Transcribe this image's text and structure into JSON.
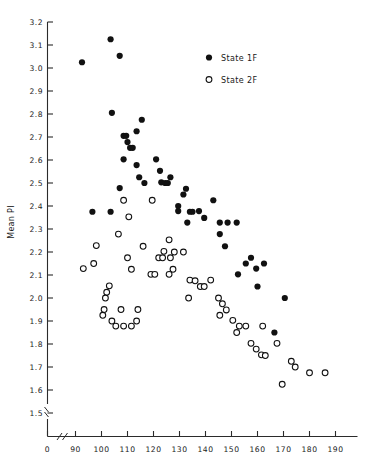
{
  "chart_data": {
    "type": "scatter",
    "title": "",
    "xlabel": "",
    "ylabel": "Mean PI",
    "xlim": [
      85,
      190
    ],
    "ylim": [
      1.45,
      3.2
    ],
    "grid": false,
    "axis_break": true,
    "legend_position": "top-right",
    "xticks": [
      "0",
      "90",
      "100",
      "110",
      "120",
      "130",
      "140",
      "150",
      "160",
      "170",
      "180",
      "190"
    ],
    "xtick_values": [
      0,
      90,
      100,
      110,
      120,
      130,
      140,
      150,
      160,
      170,
      180,
      190
    ],
    "yticks": [
      "1.5",
      "1.6",
      "1.7",
      "1.8",
      "1.9",
      "2.0",
      "2.1",
      "2.2",
      "2.3",
      "2.4",
      "2.5",
      "2.6",
      "2.7",
      "2.8",
      "2.9",
      "3.0",
      "3.1",
      "3.2"
    ],
    "ytick_values": [
      1.5,
      1.6,
      1.7,
      1.8,
      1.9,
      2.0,
      2.1,
      2.2,
      2.3,
      2.4,
      2.5,
      2.6,
      2.7,
      2.8,
      2.9,
      3.0,
      3.1,
      3.2
    ],
    "series": [
      {
        "name": "State 1F",
        "marker": "filled-circle",
        "color": "#111111",
        "points": [
          [
            92.5,
            3.025
          ],
          [
            103.5,
            3.125
          ],
          [
            107.0,
            3.053
          ],
          [
            104.0,
            2.805
          ],
          [
            115.5,
            2.775
          ],
          [
            108.5,
            2.705
          ],
          [
            109.5,
            2.705
          ],
          [
            110.0,
            2.678
          ],
          [
            113.5,
            2.725
          ],
          [
            111.0,
            2.653
          ],
          [
            112.0,
            2.653
          ],
          [
            108.5,
            2.603
          ],
          [
            121.0,
            2.603
          ],
          [
            113.5,
            2.578
          ],
          [
            122.5,
            2.553
          ],
          [
            114.5,
            2.525
          ],
          [
            126.5,
            2.525
          ],
          [
            116.5,
            2.5
          ],
          [
            123.0,
            2.503
          ],
          [
            124.5,
            2.5
          ],
          [
            125.5,
            2.5
          ],
          [
            107.0,
            2.478
          ],
          [
            132.5,
            2.475
          ],
          [
            131.5,
            2.45
          ],
          [
            129.5,
            2.4
          ],
          [
            143.0,
            2.425
          ],
          [
            96.5,
            2.375
          ],
          [
            103.5,
            2.375
          ],
          [
            129.5,
            2.378
          ],
          [
            134.0,
            2.375
          ],
          [
            135.0,
            2.375
          ],
          [
            137.5,
            2.378
          ],
          [
            133.0,
            2.328
          ],
          [
            139.5,
            2.348
          ],
          [
            145.5,
            2.328
          ],
          [
            148.5,
            2.328
          ],
          [
            152.0,
            2.328
          ],
          [
            145.5,
            2.278
          ],
          [
            147.5,
            2.225
          ],
          [
            157.5,
            2.175
          ],
          [
            155.5,
            2.15
          ],
          [
            162.5,
            2.15
          ],
          [
            159.5,
            2.128
          ],
          [
            152.5,
            2.103
          ],
          [
            160.0,
            2.05
          ],
          [
            170.5,
            2.0
          ],
          [
            166.5,
            1.85
          ]
        ]
      },
      {
        "name": "State 2F",
        "marker": "open-circle",
        "color": "#111111",
        "points": [
          [
            108.5,
            2.425
          ],
          [
            119.5,
            2.425
          ],
          [
            110.5,
            2.353
          ],
          [
            106.5,
            2.278
          ],
          [
            126.0,
            2.253
          ],
          [
            98.0,
            2.228
          ],
          [
            116.0,
            2.225
          ],
          [
            110.0,
            2.175
          ],
          [
            122.0,
            2.175
          ],
          [
            123.5,
            2.175
          ],
          [
            126.5,
            2.175
          ],
          [
            128.0,
            2.2
          ],
          [
            124.0,
            2.203
          ],
          [
            131.5,
            2.2
          ],
          [
            93.0,
            2.128
          ],
          [
            97.0,
            2.15
          ],
          [
            111.5,
            2.125
          ],
          [
            127.5,
            2.125
          ],
          [
            119.0,
            2.103
          ],
          [
            120.5,
            2.103
          ],
          [
            126.0,
            2.103
          ],
          [
            134.0,
            2.078
          ],
          [
            136.0,
            2.075
          ],
          [
            142.0,
            2.078
          ],
          [
            138.0,
            2.05
          ],
          [
            139.5,
            2.05
          ],
          [
            103.0,
            2.053
          ],
          [
            102.0,
            2.025
          ],
          [
            101.5,
            2.0
          ],
          [
            133.5,
            2.0
          ],
          [
            145.0,
            2.0
          ],
          [
            146.5,
            1.975
          ],
          [
            101.0,
            1.95
          ],
          [
            107.5,
            1.95
          ],
          [
            114.0,
            1.95
          ],
          [
            148.0,
            1.948
          ],
          [
            100.5,
            1.925
          ],
          [
            145.5,
            1.925
          ],
          [
            104.0,
            1.9
          ],
          [
            113.5,
            1.9
          ],
          [
            150.5,
            1.903
          ],
          [
            105.5,
            1.878
          ],
          [
            108.5,
            1.878
          ],
          [
            111.5,
            1.878
          ],
          [
            153.0,
            1.878
          ],
          [
            155.5,
            1.878
          ],
          [
            162.0,
            1.878
          ],
          [
            152.0,
            1.85
          ],
          [
            157.5,
            1.803
          ],
          [
            167.5,
            1.803
          ],
          [
            159.5,
            1.778
          ],
          [
            161.5,
            1.753
          ],
          [
            163.0,
            1.75
          ],
          [
            173.0,
            1.725
          ],
          [
            174.5,
            1.7
          ],
          [
            180.0,
            1.675
          ],
          [
            186.0,
            1.675
          ],
          [
            169.5,
            1.625
          ]
        ]
      }
    ]
  },
  "axes": {
    "ylabel": "Mean PI"
  },
  "legend": {
    "items": [
      {
        "label": "State 1F",
        "marker": "filled-circle"
      },
      {
        "label": "State 2F",
        "marker": "open-circle"
      }
    ]
  }
}
